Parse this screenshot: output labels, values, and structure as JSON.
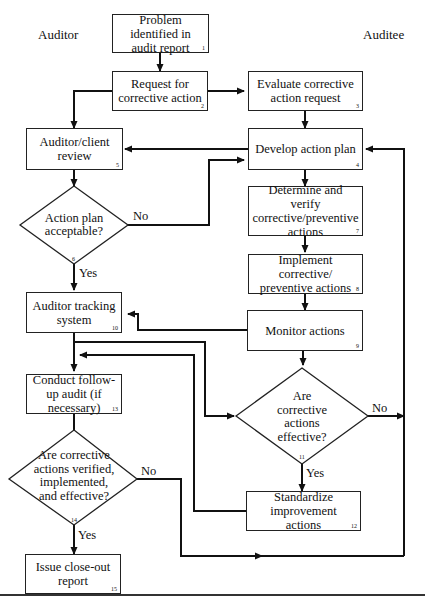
{
  "lanes": {
    "left": "Auditor",
    "right": "Auditee"
  },
  "nodes": {
    "n1": {
      "label": "Problem identified in audit report",
      "num": "1"
    },
    "n2": {
      "label": "Request for corrective action",
      "num": "2"
    },
    "n3": {
      "label": "Evaluate corrective action request",
      "num": "3"
    },
    "n4": {
      "label": "Develop action plan",
      "num": "4"
    },
    "n5": {
      "label": "Auditor/client review",
      "num": "5"
    },
    "n6": {
      "label": "Action plan acceptable?",
      "num": "6"
    },
    "n7": {
      "label": "Determine and verify corrective/preventive actions",
      "num": "7"
    },
    "n8": {
      "label": "Implement corrective/ preventive actions",
      "num": "8"
    },
    "n9": {
      "label": "Monitor actions",
      "num": "9"
    },
    "n10": {
      "label": "Auditor tracking system",
      "num": "10"
    },
    "n11": {
      "label": "Are corrective actions effective?",
      "num": "11"
    },
    "n12": {
      "label": "Standardize improvement actions",
      "num": "12"
    },
    "n13": {
      "label": "Conduct follow-up audit (if necessary)",
      "num": "13"
    },
    "n14": {
      "label": "Are corrective actions verified, implemented, and effective?",
      "num": "14"
    },
    "n15": {
      "label": "Issue close-out report",
      "num": "15"
    }
  },
  "edge_labels": {
    "n6_no": "No",
    "n6_yes": "Yes",
    "n11_no": "No",
    "n11_yes": "Yes",
    "n14_no": "No",
    "n14_yes": "Yes"
  },
  "colors": {
    "line": "#111111",
    "background": "#ffffff"
  }
}
